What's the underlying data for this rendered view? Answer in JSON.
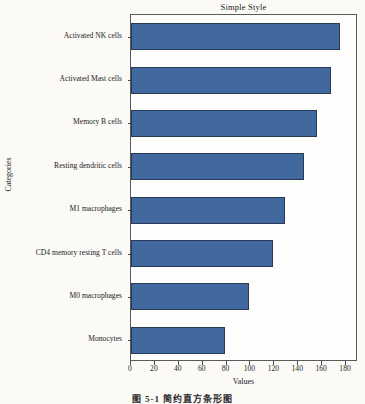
{
  "figure": {
    "caption": "图 5-1   简约直方条形图",
    "background_color": "#fbfaf7"
  },
  "chart_data": {
    "type": "bar",
    "orientation": "horizontal",
    "title": "Simple Style",
    "xlabel": "Values",
    "ylabel": "Categories",
    "categories": [
      "Activated NK cells",
      "Activated Mast cells",
      "Memory B cells",
      "Resting dendritic cells",
      "M1 macrophages",
      "CD4 memory resting T cells",
      "M0 macrophages",
      "Monocytes"
    ],
    "values": [
      175,
      167,
      156,
      145,
      129,
      119,
      99,
      79
    ],
    "xlim": [
      0,
      190
    ],
    "xticks": [
      0,
      20,
      40,
      60,
      80,
      100,
      120,
      140,
      160,
      180
    ],
    "xtick_labels": [
      "0",
      "20",
      "40",
      "60",
      "80",
      "100",
      "120",
      "140",
      "160",
      "180"
    ],
    "grid": false,
    "legend": null,
    "bar_color": "#41699f",
    "bar_edge_color": "#2a3a52"
  }
}
